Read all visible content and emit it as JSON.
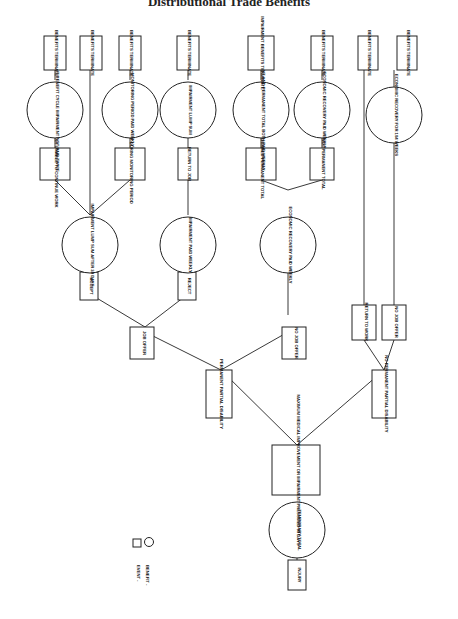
{
  "page": {
    "title": "Distributional Trade Benefits",
    "layout": "Rotated decision tree (read with page turned 90° clockwise); root at bottom, leaves at top"
  },
  "legend": {
    "event_label": "EVENT -",
    "event_shape": "square",
    "benefit_label": "BENEFIT -",
    "benefit_shape": "circle"
  },
  "nodes": {
    "injury": "INJURY",
    "temporary_total": "TEMPORARY TOTAL",
    "mmi": "MAXIMUM MEDICAL IMPROVEMENT OR IMPAIRMENT PRESUMED 90 DAYS",
    "ppd": "PERMANENT PARTIAL DISABILITY",
    "no_ppd": "NO PERMANENT PARTIAL DISABILITY",
    "job_offer": "JOB OFFER",
    "no_job_offer_a": "NO JOB OFFER",
    "return_to_work": "RETURN TO WORK",
    "no_job_offer_b": "NO JOB OFFER",
    "accept": "ACCEPT",
    "reject": "REJECT",
    "impairment_lump_after": "IMPAIRMENT LUMP SUM AFTER 30 DAYS",
    "impairment_paid_weekly": "IMPAIRMENT PAID WEEKLY",
    "econ_recovery_paid_weekly": "ECONOMIC RECOVERY PAID WEEKLY",
    "econ_recovery_104": "ECONOMIC RECOVERY FOR 104 WEEKS",
    "medically_unable": "MEDICALLY UNABLE TO CONTINUE WORK",
    "layoff": "LAYOFF DURING MONITORING PERIOD",
    "return_to_job": "RETURN TO JOB",
    "determined_ptd": "DETERMINED PERMANENT TOTAL",
    "not_ptd": "NOT PERMANENT TOTAL",
    "impairment_then_econ": "IMPAIRMENT BENEFIT CYCLE IMPAIRMENT NOT PAID TWICE",
    "monitoring_weekly": "MONITORING PERIOD PAID WEEKLY",
    "impairment_lump_sum": "IMPAIRMENT LUMP SUM",
    "impairment_and_ptd": "IMPAIRMENT AND PERMANENT TOTAL BOTH PAID WEEKLY",
    "econ_recovery_weekly_top": "ECONOMIC RECOVERY PAID WEEKLY",
    "benefits_terminate": "BENEFITS TERMINATE",
    "impairment_benefits_terminate": "IMPAIRMENT BENEFITS TERMINATE"
  }
}
